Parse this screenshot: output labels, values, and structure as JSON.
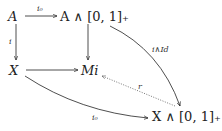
{
  "diagram": {
    "nodes": {
      "A": "A",
      "A_smash": "A ∧ [0, 1]₊",
      "X": "X",
      "Mi": "Mi",
      "X_smash": "X ∧ [0, 1]₊"
    },
    "labels": {
      "top": "i₀",
      "left": "i",
      "curve_right": "i∧Id",
      "dotted": "r",
      "curve_bottom": "i₀"
    },
    "colors": {
      "ink": "#222222",
      "dotted": "#555555"
    }
  }
}
